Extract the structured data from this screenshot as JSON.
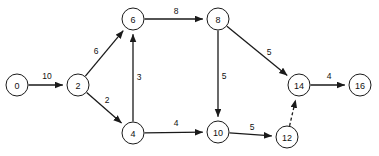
{
  "diagram": {
    "type": "directed-graph",
    "background_color": "#ffffff",
    "stroke_color": "#1a1a1a",
    "node_radius": 11,
    "nodes": [
      {
        "id": "0",
        "label": "0",
        "x": 17,
        "y": 85
      },
      {
        "id": "2",
        "label": "2",
        "x": 78,
        "y": 85
      },
      {
        "id": "6",
        "label": "6",
        "x": 133,
        "y": 19
      },
      {
        "id": "4",
        "label": "4",
        "x": 133,
        "y": 133
      },
      {
        "id": "8",
        "label": "8",
        "x": 218,
        "y": 19
      },
      {
        "id": "10",
        "label": "10",
        "x": 218,
        "y": 132
      },
      {
        "id": "12",
        "label": "12",
        "x": 287,
        "y": 137
      },
      {
        "id": "14",
        "label": "14",
        "x": 299,
        "y": 85
      },
      {
        "id": "16",
        "label": "16",
        "x": 360,
        "y": 85
      }
    ],
    "edges": [
      {
        "from": "0",
        "to": "2",
        "weight": "10",
        "style": "solid",
        "label_x": 47,
        "label_y": 76
      },
      {
        "from": "2",
        "to": "6",
        "weight": "6",
        "style": "solid",
        "label_x": 96,
        "label_y": 51
      },
      {
        "from": "2",
        "to": "4",
        "weight": "2",
        "style": "solid",
        "label_x": 107,
        "label_y": 100
      },
      {
        "from": "4",
        "to": "6",
        "weight": "3",
        "style": "solid",
        "label_x": 139,
        "label_y": 77
      },
      {
        "from": "6",
        "to": "8",
        "weight": "8",
        "style": "solid",
        "label_x": 176,
        "label_y": 11
      },
      {
        "from": "8",
        "to": "10",
        "weight": "5",
        "style": "solid",
        "label_x": 224,
        "label_y": 76
      },
      {
        "from": "8",
        "to": "14",
        "weight": "5",
        "style": "solid",
        "label_x": 269,
        "label_y": 52
      },
      {
        "from": "4",
        "to": "10",
        "weight": "4",
        "style": "solid",
        "label_x": 176,
        "label_y": 123
      },
      {
        "from": "10",
        "to": "12",
        "weight": "5",
        "style": "solid",
        "label_x": 252,
        "label_y": 127
      },
      {
        "from": "12",
        "to": "14",
        "weight": "",
        "style": "dashed",
        "label_x": 0,
        "label_y": 0
      },
      {
        "from": "14",
        "to": "16",
        "weight": "4",
        "style": "solid",
        "label_x": 329,
        "label_y": 76
      }
    ]
  }
}
